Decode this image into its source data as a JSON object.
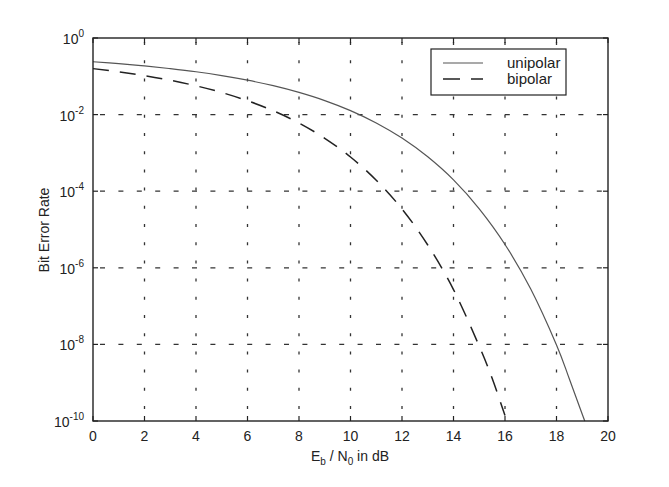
{
  "chart_data": {
    "type": "line",
    "title": "",
    "xlabel": "E_b / N_0 in dB",
    "xlabel_parts": {
      "E": "E",
      "b": "b",
      "slash": " / N",
      "zero": "0",
      "tail": " in dB"
    },
    "ylabel": "Bit Error Rate",
    "xlim": [
      0,
      20
    ],
    "ylim": [
      1e-10,
      1
    ],
    "yscale": "log",
    "grid": true,
    "legend_position": "upper right",
    "x_ticks": [
      "0",
      "2",
      "4",
      "6",
      "8",
      "10",
      "12",
      "14",
      "16",
      "18",
      "20"
    ],
    "y_ticks": [
      {
        "base": "10",
        "exp": "0",
        "log": 0
      },
      {
        "base": "10",
        "exp": "-2",
        "log": -2
      },
      {
        "base": "10",
        "exp": "-4",
        "log": -4
      },
      {
        "base": "10",
        "exp": "-6",
        "log": -6
      },
      {
        "base": "10",
        "exp": "-8",
        "log": -8
      },
      {
        "base": "10",
        "exp": "-10",
        "log": -10
      }
    ],
    "series": [
      {
        "name": "unipolar",
        "style": "solid",
        "x": [
          0,
          1,
          2,
          3,
          4,
          5,
          6,
          7,
          8,
          9,
          10,
          11,
          12,
          13,
          14,
          15,
          16,
          17,
          18,
          18.5,
          19,
          19.1
        ],
        "values": [
          0.2398,
          0.2143,
          0.1867,
          0.1586,
          0.1312,
          0.104,
          0.0791,
          0.0569,
          0.0379,
          0.0232,
          0.0127,
          0.00606,
          0.00244,
          0.000789,
          0.000197,
          3.47e-05,
          4.06e-06,
          2.78e-07,
          9.7e-09,
          1.25e-09,
          1.5e-10,
          1e-10
        ]
      },
      {
        "name": "bipolar",
        "style": "dashed",
        "x": [
          0,
          1,
          2,
          3,
          4,
          5,
          6,
          7,
          8,
          9,
          10,
          11,
          12,
          13,
          14,
          15,
          15.5,
          16
        ],
        "values": [
          0.1587,
          0.1309,
          0.104,
          0.0789,
          0.0565,
          0.0377,
          0.023,
          0.0126,
          0.00601,
          0.00241,
          0.000783,
          0.000193,
          3.43e-05,
          3.94e-06,
          2.7e-07,
          9e-09,
          1.3e-09,
          1.4e-10
        ]
      }
    ]
  },
  "legend": {
    "items": [
      {
        "label": "unipolar",
        "style": "solid"
      },
      {
        "label": "bipolar",
        "style": "dashed"
      }
    ]
  },
  "colors": {
    "axis": "#222222",
    "grid": "#333333",
    "unipolar": "#555555",
    "bipolar": "#222222"
  }
}
